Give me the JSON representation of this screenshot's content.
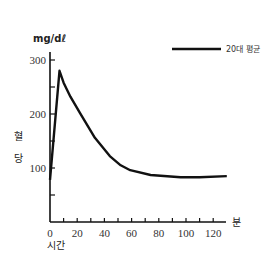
{
  "chart_data": {
    "type": "line",
    "title": "",
    "xlabel": "시간",
    "xunit": "분",
    "ylabel": "혈당",
    "yunit": "mg/dℓ",
    "xlim": [
      0,
      130
    ],
    "ylim": [
      0,
      340
    ],
    "x_ticks": [
      0,
      20,
      40,
      60,
      80,
      100,
      120
    ],
    "x_minor_ticks": [
      10,
      20,
      30,
      40,
      50,
      60,
      70,
      80,
      90,
      100,
      110,
      120
    ],
    "y_ticks": [
      100,
      200,
      300
    ],
    "y_minor_ticks": [
      50,
      150,
      250
    ],
    "grid": false,
    "legend_position": "top-right",
    "series": [
      {
        "name": "20대 평균",
        "x": [
          0,
          7,
          10,
          15,
          22,
          33,
          44,
          52,
          59,
          74,
          96,
          110,
          130
        ],
        "values": [
          78,
          280,
          258,
          232,
          202,
          156,
          122,
          105,
          96,
          87,
          83,
          83,
          85
        ]
      }
    ]
  },
  "labels": {
    "yunit": "mg/dℓ",
    "ylabel_top": "혈",
    "ylabel_bottom": "당",
    "xlabel": "시간",
    "xunit": "분",
    "legend": "20대 평균"
  }
}
